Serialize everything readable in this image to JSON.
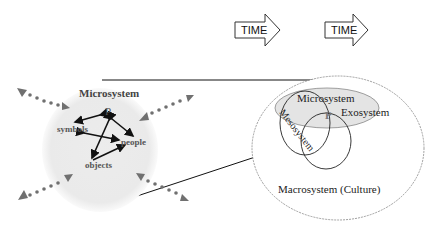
{
  "time_arrows": [
    {
      "label": "TIME"
    },
    {
      "label": "TIME"
    }
  ],
  "left_diagram": {
    "title": "Microsystem",
    "center": "P",
    "nodes": [
      "symbols",
      "people",
      "objects"
    ]
  },
  "right_diagram": {
    "microsystem": "Microsystem",
    "mesosystem": "Mesosystem",
    "exosystem": "Exosystem",
    "center": "P",
    "macrosystem": "Macrosystem (Culture)"
  },
  "colors": {
    "shaded": "#e6e6e6",
    "arrow_gray": "#707070",
    "line": "#111111"
  }
}
